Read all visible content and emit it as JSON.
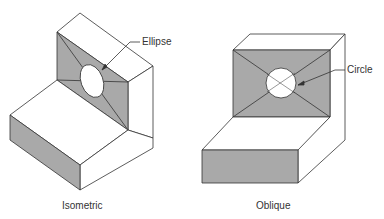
{
  "figures": [
    {
      "name": "isometric",
      "caption": "Isometric",
      "callout": "Ellipse"
    },
    {
      "name": "oblique",
      "caption": "Oblique",
      "callout": "Circle"
    }
  ],
  "colors": {
    "face_shade": "#a9a9a9",
    "line": "#333333",
    "background": "#ffffff"
  }
}
